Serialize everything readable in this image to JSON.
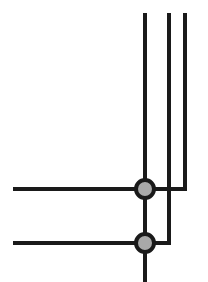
{
  "diagram": {
    "type": "line-junction-schematic",
    "colors": {
      "line": "#1a1a1a",
      "node_fill": "#a9a9a9",
      "background": "#ffffff"
    },
    "vertical_lines": [
      {
        "id": "v-main",
        "x": 145,
        "y1": 15,
        "y2": 282
      },
      {
        "id": "v-mid",
        "x": 169,
        "y1": 15,
        "y2": 243
      },
      {
        "id": "v-right",
        "x": 185,
        "y1": 15,
        "y2": 189
      }
    ],
    "horizontal_lines": [
      {
        "id": "h-upper",
        "y": 189,
        "x1": 15,
        "x2": 185
      },
      {
        "id": "h-lower",
        "y": 243,
        "x1": 15,
        "x2": 169
      }
    ],
    "nodes": [
      {
        "id": "junction-upper",
        "cx": 145,
        "cy": 189
      },
      {
        "id": "junction-lower",
        "cx": 145,
        "cy": 243
      }
    ]
  }
}
